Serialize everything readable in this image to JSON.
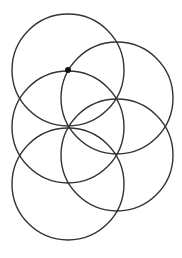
{
  "diagram": {
    "type": "overlapping-circles",
    "width": 182,
    "height": 258,
    "stroke_color": "#333333",
    "stroke_width": 1.4,
    "point_color": "#111111",
    "circles": [
      {
        "id": "circle-top-left",
        "cx": 68,
        "cy": 70,
        "r": 56
      },
      {
        "id": "circle-top-right",
        "cx": 117,
        "cy": 98,
        "r": 56
      },
      {
        "id": "circle-middle-left",
        "cx": 68,
        "cy": 127,
        "r": 56
      },
      {
        "id": "circle-middle-right",
        "cx": 117,
        "cy": 155,
        "r": 56
      },
      {
        "id": "circle-bottom-left",
        "cx": 68,
        "cy": 184,
        "r": 56
      }
    ],
    "points": [
      {
        "id": "marked-point",
        "cx": 68,
        "cy": 70,
        "r": 3
      }
    ]
  }
}
